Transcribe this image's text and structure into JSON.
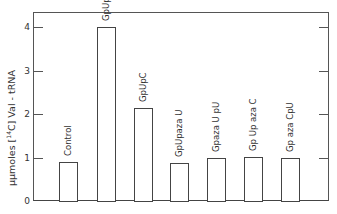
{
  "chart_data": {
    "type": "bar",
    "title": "",
    "xlabel": "",
    "ylabel": "µµmoles [14C] Val-tRNA",
    "ylim": [
      0,
      4.3
    ],
    "yticks": [
      0,
      1,
      2,
      3,
      4
    ],
    "grid": false,
    "legend": null,
    "categories": [
      "Control",
      "GpUpU",
      "GpUpC",
      "GpUpaza U",
      "Gpaza U pU",
      "Gp Up aza C",
      "Gp aza CpU"
    ],
    "values": [
      0.9,
      4.0,
      2.13,
      0.88,
      0.98,
      1.0,
      0.98
    ]
  },
  "axis": {
    "ylabel_prefix": "µµmoles [",
    "ylabel_sup": "14",
    "ylabel_suffix": "C] Val - tRNA",
    "tick_labels": [
      "0",
      "1",
      "2",
      "3",
      "4"
    ]
  },
  "colors": {
    "line": "#444444",
    "background": "#ffffff",
    "bar_fill": "#ffffff"
  }
}
